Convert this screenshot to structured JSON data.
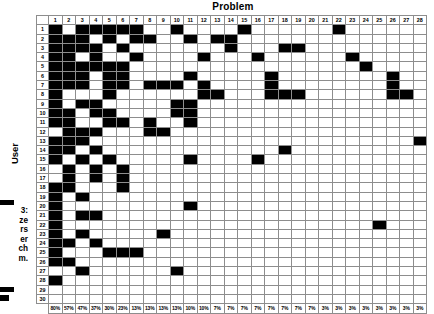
{
  "chart_data": {
    "type": "heatmap",
    "title": "Problem",
    "xlabel": "Problem",
    "ylabel": "User",
    "x_tick_labels": [
      "1",
      "2",
      "3",
      "4",
      "5",
      "6",
      "7",
      "8",
      "9",
      "10",
      "11",
      "12",
      "13",
      "14",
      "15",
      "16",
      "17",
      "18",
      "19",
      "20",
      "21",
      "22",
      "23",
      "24",
      "25",
      "26",
      "27",
      "28"
    ],
    "y_tick_labels": [
      "1",
      "2",
      "3",
      "4",
      "5",
      "6",
      "7",
      "8",
      "9",
      "10",
      "11",
      "12",
      "13",
      "14",
      "15",
      "16",
      "17",
      "18",
      "19",
      "20",
      "21",
      "22",
      "23",
      "24",
      "25",
      "26",
      "27",
      "28",
      "29",
      "30"
    ],
    "grid": true,
    "legend_position": "none",
    "value_encoding": {
      "1": "filled-black (problem encountered)",
      "0": "empty-white"
    },
    "column_percentages": [
      "80%",
      "57%",
      "47%",
      "37%",
      "30%",
      "23%",
      "13%",
      "13%",
      "13%",
      "13%",
      "10%",
      "10%",
      "7%",
      "7%",
      "7%",
      "7%",
      "7%",
      "7%",
      "7%",
      "7%",
      "3%",
      "3%",
      "3%",
      "3%",
      "3%",
      "3%",
      "3%",
      "3%"
    ],
    "matrix": [
      [
        1,
        0,
        1,
        1,
        1,
        1,
        1,
        0,
        0,
        1,
        0,
        0,
        0,
        0,
        1,
        0,
        0,
        0,
        0,
        0,
        0,
        1,
        0,
        0,
        0,
        0,
        0,
        0
      ],
      [
        1,
        1,
        1,
        0,
        1,
        0,
        1,
        1,
        0,
        0,
        1,
        0,
        1,
        1,
        0,
        0,
        0,
        0,
        0,
        0,
        0,
        0,
        0,
        0,
        0,
        0,
        0,
        0
      ],
      [
        1,
        1,
        1,
        1,
        0,
        1,
        0,
        0,
        0,
        0,
        0,
        0,
        0,
        1,
        0,
        0,
        0,
        1,
        1,
        0,
        0,
        0,
        0,
        0,
        0,
        0,
        0,
        0
      ],
      [
        1,
        1,
        0,
        1,
        0,
        0,
        1,
        0,
        0,
        0,
        0,
        1,
        0,
        0,
        0,
        1,
        0,
        0,
        0,
        0,
        0,
        0,
        1,
        0,
        0,
        0,
        0,
        0
      ],
      [
        1,
        1,
        1,
        1,
        1,
        1,
        0,
        0,
        0,
        0,
        0,
        0,
        0,
        0,
        0,
        0,
        0,
        0,
        0,
        0,
        0,
        0,
        0,
        1,
        0,
        0,
        0,
        0
      ],
      [
        1,
        1,
        1,
        0,
        1,
        1,
        0,
        0,
        0,
        0,
        1,
        0,
        0,
        0,
        0,
        0,
        1,
        0,
        0,
        0,
        0,
        0,
        0,
        0,
        0,
        1,
        0,
        0
      ],
      [
        1,
        1,
        1,
        0,
        1,
        1,
        0,
        1,
        1,
        1,
        0,
        1,
        0,
        0,
        0,
        0,
        1,
        0,
        0,
        0,
        0,
        0,
        0,
        0,
        0,
        1,
        0,
        0
      ],
      [
        1,
        0,
        0,
        0,
        1,
        0,
        0,
        0,
        0,
        0,
        0,
        1,
        1,
        0,
        0,
        0,
        1,
        1,
        1,
        0,
        0,
        0,
        0,
        0,
        0,
        1,
        1,
        0
      ],
      [
        1,
        0,
        1,
        1,
        0,
        0,
        0,
        0,
        0,
        1,
        1,
        0,
        0,
        0,
        0,
        0,
        0,
        0,
        0,
        0,
        0,
        0,
        0,
        0,
        0,
        0,
        0,
        0
      ],
      [
        1,
        1,
        0,
        1,
        1,
        0,
        0,
        0,
        0,
        1,
        1,
        0,
        0,
        0,
        0,
        0,
        0,
        0,
        0,
        0,
        0,
        0,
        0,
        0,
        0,
        0,
        0,
        0
      ],
      [
        1,
        1,
        0,
        0,
        1,
        1,
        0,
        1,
        0,
        0,
        1,
        0,
        0,
        0,
        0,
        0,
        0,
        0,
        0,
        0,
        0,
        0,
        0,
        0,
        0,
        0,
        0,
        0
      ],
      [
        0,
        1,
        1,
        1,
        0,
        0,
        0,
        1,
        1,
        0,
        0,
        0,
        0,
        0,
        0,
        0,
        0,
        0,
        0,
        0,
        0,
        0,
        0,
        0,
        0,
        0,
        0,
        0
      ],
      [
        1,
        1,
        1,
        0,
        0,
        0,
        0,
        0,
        0,
        0,
        0,
        0,
        0,
        0,
        0,
        0,
        0,
        0,
        0,
        0,
        0,
        0,
        0,
        0,
        0,
        0,
        0,
        1
      ],
      [
        1,
        1,
        0,
        1,
        0,
        0,
        0,
        0,
        0,
        0,
        0,
        0,
        0,
        0,
        0,
        0,
        0,
        1,
        0,
        0,
        0,
        0,
        0,
        0,
        0,
        0,
        0,
        0
      ],
      [
        1,
        0,
        1,
        0,
        1,
        0,
        0,
        0,
        0,
        0,
        1,
        0,
        0,
        0,
        0,
        1,
        0,
        0,
        0,
        0,
        0,
        0,
        0,
        0,
        0,
        0,
        0,
        0
      ],
      [
        0,
        1,
        0,
        1,
        0,
        1,
        0,
        0,
        0,
        0,
        0,
        0,
        0,
        0,
        0,
        0,
        0,
        0,
        0,
        0,
        0,
        0,
        0,
        0,
        0,
        0,
        0,
        0
      ],
      [
        0,
        1,
        0,
        1,
        0,
        1,
        0,
        0,
        0,
        0,
        0,
        0,
        0,
        0,
        0,
        0,
        0,
        0,
        0,
        0,
        0,
        0,
        0,
        0,
        0,
        0,
        0,
        0
      ],
      [
        1,
        1,
        0,
        0,
        0,
        1,
        0,
        0,
        0,
        0,
        0,
        0,
        0,
        0,
        0,
        0,
        0,
        0,
        0,
        0,
        0,
        0,
        0,
        0,
        0,
        0,
        0,
        0
      ],
      [
        1,
        0,
        1,
        0,
        0,
        0,
        0,
        0,
        0,
        0,
        0,
        0,
        0,
        0,
        0,
        0,
        0,
        0,
        0,
        0,
        0,
        0,
        0,
        0,
        0,
        0,
        0,
        0
      ],
      [
        1,
        0,
        0,
        0,
        0,
        0,
        0,
        0,
        0,
        0,
        1,
        0,
        0,
        0,
        0,
        0,
        0,
        0,
        0,
        0,
        0,
        0,
        0,
        0,
        0,
        0,
        0,
        0
      ],
      [
        1,
        0,
        1,
        1,
        0,
        0,
        0,
        0,
        0,
        0,
        0,
        0,
        0,
        0,
        0,
        0,
        0,
        0,
        0,
        0,
        0,
        0,
        0,
        0,
        0,
        0,
        0,
        0
      ],
      [
        1,
        0,
        0,
        0,
        0,
        0,
        0,
        0,
        0,
        0,
        0,
        0,
        0,
        0,
        0,
        0,
        0,
        0,
        0,
        0,
        0,
        0,
        0,
        0,
        1,
        0,
        0,
        0
      ],
      [
        1,
        0,
        1,
        0,
        0,
        0,
        0,
        0,
        1,
        0,
        0,
        0,
        0,
        0,
        0,
        0,
        0,
        0,
        0,
        0,
        0,
        0,
        0,
        0,
        0,
        0,
        0,
        0
      ],
      [
        1,
        1,
        0,
        1,
        0,
        0,
        0,
        0,
        0,
        0,
        0,
        0,
        0,
        0,
        0,
        0,
        0,
        0,
        0,
        0,
        0,
        0,
        0,
        0,
        0,
        0,
        0,
        0
      ],
      [
        1,
        0,
        0,
        0,
        1,
        1,
        1,
        0,
        0,
        0,
        0,
        0,
        0,
        0,
        0,
        0,
        0,
        0,
        0,
        0,
        0,
        0,
        0,
        0,
        0,
        0,
        0,
        0
      ],
      [
        1,
        1,
        0,
        0,
        0,
        0,
        0,
        0,
        0,
        0,
        0,
        0,
        0,
        0,
        0,
        0,
        0,
        0,
        0,
        0,
        0,
        0,
        0,
        0,
        0,
        0,
        0,
        0
      ],
      [
        0,
        0,
        1,
        0,
        0,
        0,
        0,
        0,
        0,
        1,
        0,
        0,
        0,
        0,
        0,
        0,
        0,
        0,
        0,
        0,
        0,
        0,
        0,
        0,
        0,
        0,
        0,
        0
      ],
      [
        1,
        0,
        0,
        0,
        0,
        0,
        0,
        0,
        0,
        0,
        0,
        0,
        0,
        0,
        0,
        0,
        0,
        0,
        0,
        0,
        0,
        0,
        0,
        0,
        0,
        0,
        0,
        0
      ],
      [
        0,
        0,
        0,
        0,
        0,
        0,
        0,
        0,
        0,
        0,
        0,
        0,
        0,
        0,
        0,
        0,
        0,
        0,
        0,
        0,
        0,
        0,
        0,
        0,
        0,
        0,
        0,
        0
      ],
      [
        0,
        0,
        0,
        0,
        0,
        0,
        0,
        0,
        0,
        0,
        0,
        0,
        0,
        0,
        0,
        0,
        0,
        0,
        0,
        0,
        0,
        0,
        0,
        0,
        0,
        0,
        0,
        0
      ]
    ]
  },
  "labels": {
    "title": "Problem",
    "y_axis": "User",
    "side_caption": "3:\nze\nrs\ner\nch\nm."
  }
}
